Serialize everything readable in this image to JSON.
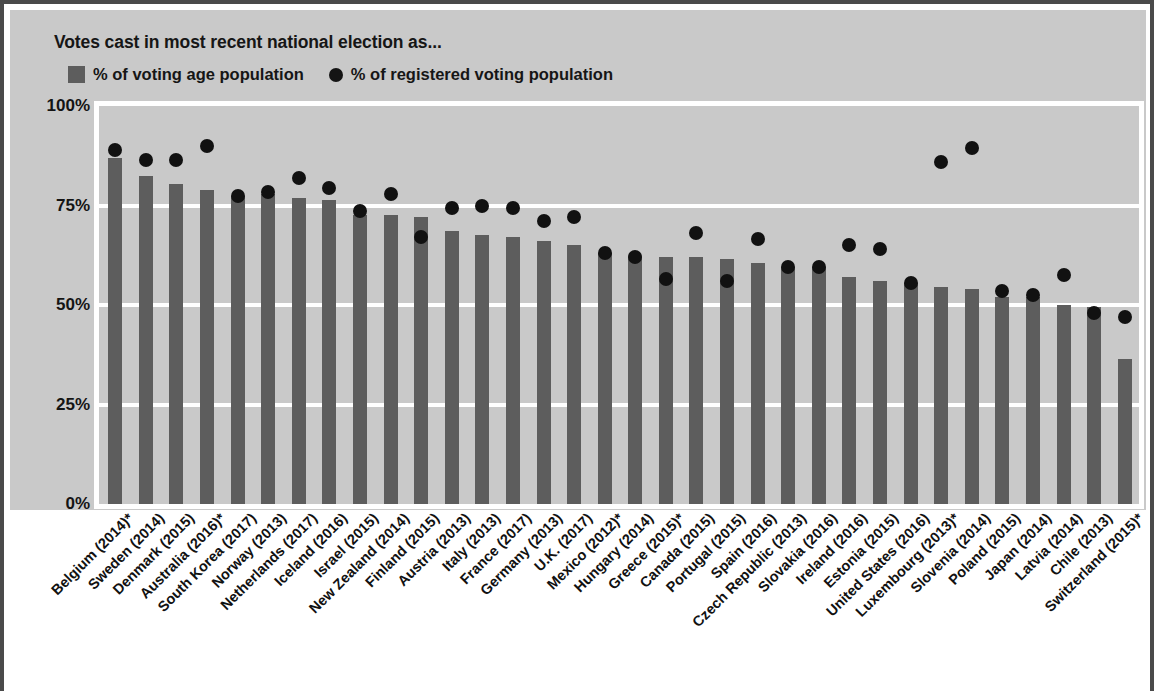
{
  "chart": {
    "title": "Votes cast in most recent national election as...",
    "legend": [
      {
        "name": "bar-swatch",
        "label": "% of voting age population"
      },
      {
        "name": "dot-swatch",
        "label": "% of registered voting population"
      }
    ],
    "y_ticks": [
      "100%",
      "75%",
      "50%",
      "25%",
      "0%"
    ],
    "colors": {
      "bar": "#5d5d5d",
      "dot": "#111111",
      "panel": "#c9c9c9",
      "gridline": "#ffffff",
      "frame": "#4a4a4a",
      "text": "#141414"
    }
  },
  "chart_data": {
    "type": "bar",
    "title": "Votes cast in most recent national election as...",
    "xlabel": "",
    "ylabel": "",
    "ylim": [
      0,
      100
    ],
    "yticks": [
      0,
      25,
      50,
      75,
      100
    ],
    "grid": true,
    "legend_position": "top-left",
    "categories": [
      "Belgium (2014)*",
      "Sweden (2014)",
      "Denmark (2015)",
      "Australia (2016)*",
      "South Korea (2017)",
      "Norway (2013)",
      "Netherlands (2017)",
      "Iceland (2016)",
      "Israel (2015)",
      "New Zealand (2014)",
      "Finland (2015)",
      "Austria (2013)",
      "Italy (2013)",
      "France (2017)",
      "Germany (2013)",
      "U.K. (2017)",
      "Mexico (2012)*",
      "Hungary (2014)",
      "Greece (2015)*",
      "Canada (2015)",
      "Portugal (2015)",
      "Spain (2016)",
      "Czech Republic (2013)",
      "Slovakia (2016)",
      "Ireland (2016)",
      "Estonia (2015)",
      "United States (2016)",
      "Luxembourg (2013)*",
      "Slovenia (2014)",
      "Poland (2015)",
      "Japan (2014)",
      "Latvia (2014)",
      "Chile (2013)",
      "Switzerland (2015)*"
    ],
    "series": [
      {
        "name": "% of voting age population",
        "type": "bar",
        "values": [
          87,
          82.5,
          80.5,
          79,
          77.5,
          78,
          77,
          76.5,
          72.5,
          72.5,
          72,
          68.5,
          67.5,
          67,
          66,
          65,
          63,
          62,
          62,
          62,
          61.5,
          60.5,
          59.5,
          59.5,
          57,
          56,
          55.5,
          54.5,
          54,
          52,
          52,
          50,
          49.5,
          36.5
        ]
      },
      {
        "name": "% of registered voting population",
        "type": "scatter",
        "values": [
          89,
          86.5,
          86.5,
          90,
          77.5,
          78.5,
          82,
          79.5,
          73.5,
          78,
          67,
          74.5,
          75,
          74.5,
          71,
          72,
          63,
          62,
          56.5,
          68,
          56,
          66.5,
          59.5,
          59.5,
          65,
          64,
          55.5,
          86,
          89.5,
          53.5,
          52.5,
          57.5,
          48,
          47
        ]
      }
    ]
  }
}
